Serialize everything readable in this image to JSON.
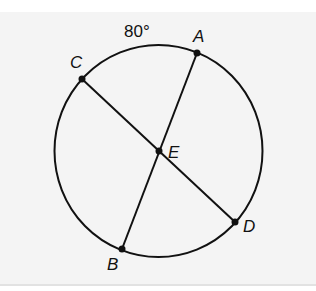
{
  "diagram": {
    "arc_label": "80°",
    "points": {
      "A": {
        "label": "A",
        "x": 197,
        "y": 53
      },
      "B": {
        "label": "B",
        "x": 122,
        "y": 249
      },
      "C": {
        "label": "C",
        "x": 82,
        "y": 79
      },
      "D": {
        "label": "D",
        "x": 235,
        "y": 222
      },
      "E": {
        "label": "E",
        "x": 159,
        "y": 151
      }
    },
    "circle": {
      "cx": 158.5,
      "cy": 151,
      "r": 104
    },
    "chords": [
      "AB",
      "CD"
    ],
    "colors": {
      "stroke": "#111111",
      "background": "#f4f4f4"
    }
  }
}
